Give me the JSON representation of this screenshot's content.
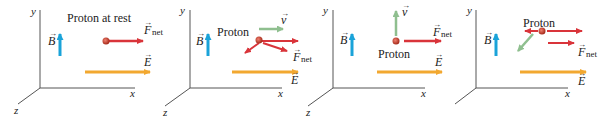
{
  "figure": {
    "colors": {
      "axis": "#555555",
      "b_field": "#1aa3d9",
      "e_field": "#f2a830",
      "force": "#d9343a",
      "velocity": "#8fbf8f",
      "proton": "#c0392b",
      "text": "#222222"
    },
    "axis_labels": {
      "x": "x",
      "y": "y",
      "z": "z"
    },
    "vector_labels": {
      "B": "B",
      "E": "E",
      "F": "F",
      "F_sub": "net",
      "v": "v"
    },
    "panels": [
      {
        "id": 1,
        "caption": "Proton at rest",
        "has_velocity": false
      },
      {
        "id": 2,
        "caption": "Proton",
        "has_velocity": true,
        "velocity_direction": "+x"
      },
      {
        "id": 3,
        "caption": "Proton",
        "has_velocity": true,
        "velocity_direction": "+y"
      },
      {
        "id": 4,
        "caption": "Proton",
        "has_velocity": true,
        "velocity_direction": "-x"
      }
    ]
  }
}
